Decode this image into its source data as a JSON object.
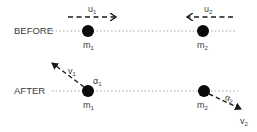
{
  "diagram": {
    "type": "collision-diagram",
    "rows": [
      {
        "label": "BEFORE",
        "masses": [
          {
            "name": "m",
            "sub": "1",
            "velocity": {
              "name": "u",
              "sub": "1",
              "direction": "right"
            }
          },
          {
            "name": "m",
            "sub": "2",
            "velocity": {
              "name": "u",
              "sub": "2",
              "direction": "left"
            }
          }
        ]
      },
      {
        "label": "AFTER",
        "masses": [
          {
            "name": "m",
            "sub": "1",
            "velocity": {
              "name": "v",
              "sub": "1",
              "direction": "up-left"
            },
            "angle": {
              "name": "α",
              "sub": "1"
            }
          },
          {
            "name": "m",
            "sub": "2",
            "velocity": {
              "name": "v",
              "sub": "2",
              "direction": "down-right"
            },
            "angle": {
              "name": "α",
              "sub": "2"
            }
          }
        ]
      }
    ],
    "colors": {
      "ball": "#0a0a0a",
      "line": "#9a9a9a",
      "arrow": "#1a1a1a",
      "text": "#3a3a3a"
    }
  }
}
